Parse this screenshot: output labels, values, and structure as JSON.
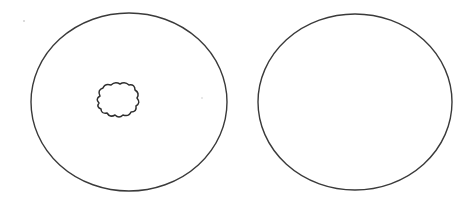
{
  "diagram": {
    "background": "#ffffff",
    "stroke_color": "#3a3a3a",
    "shapes": [
      {
        "id": "left-ellipse",
        "type": "ellipse",
        "cx": 129,
        "cy": 102,
        "rx": 98,
        "ry": 89,
        "contains": "irregular-blob"
      },
      {
        "id": "right-ellipse",
        "type": "ellipse",
        "cx": 355,
        "cy": 102,
        "rx": 97,
        "ry": 88,
        "contains": null
      }
    ],
    "blob": {
      "id": "irregular-blob",
      "type": "cloud-shape",
      "center": [
        115,
        104
      ],
      "width": 42,
      "height": 32
    }
  }
}
